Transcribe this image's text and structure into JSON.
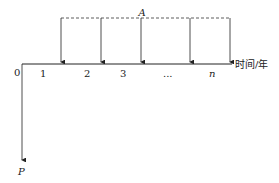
{
  "diagram": {
    "type": "cash-flow-diagram",
    "annuity_label": "A",
    "present_value_label": "P",
    "axis_label": "时间/年",
    "origin_label": "0",
    "period_labels": [
      "1",
      "2",
      "3",
      "...",
      "n"
    ]
  }
}
